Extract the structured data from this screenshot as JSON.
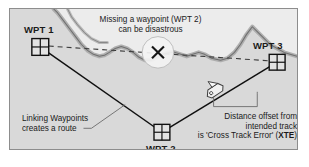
{
  "diagram": {
    "title_note": {
      "line1": "Missing a waypoint (WPT 2)",
      "line2": "can be disastrous"
    },
    "waypoints": [
      {
        "id": "wpt1",
        "label": "WPT 1",
        "marker": "waypoint-grid-square"
      },
      {
        "id": "wpt2",
        "label": "WPT 2",
        "marker": "waypoint-grid-square"
      },
      {
        "id": "wpt3",
        "label": "WPT 3",
        "marker": "waypoint-grid-square"
      }
    ],
    "hazard": {
      "symbol": "X",
      "name": "hazard-x-marker"
    },
    "vessel": {
      "name": "boat-icon"
    },
    "annotations": {
      "route_note": {
        "line1": "Linking Waypoints",
        "line2": "creates a route"
      },
      "xte_note": {
        "line1": "Distance offset from",
        "line2": "intended track",
        "line3_prefix": "is 'Cross Track Error' (",
        "line3_bold": "XTE",
        "line3_suffix": ")"
      }
    },
    "colors": {
      "water": "#d9d9d9",
      "land": "#ececec",
      "coast_shadow": "#a9a9a9",
      "coast_line": "#6f6f6f",
      "route_line": "#101010",
      "dashed_line": "#3a3a3a",
      "leader_line": "#6a6a6a",
      "frame_border": "#8d8d8d",
      "text": "#1a1a1a",
      "page_background": "#ffffff"
    }
  }
}
